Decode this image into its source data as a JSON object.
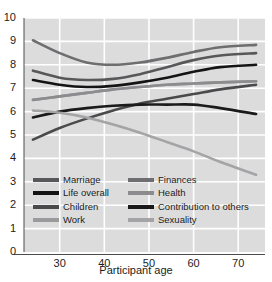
{
  "chart_data": {
    "type": "line",
    "title": "",
    "xlabel": "Participant age",
    "ylabel": "",
    "xlim": [
      22,
      76
    ],
    "ylim": [
      0,
      10
    ],
    "grid": true,
    "legend_position": "inside-bottom-left",
    "x_ticks": [
      "30",
      "40",
      "50",
      "60",
      "70"
    ],
    "x_tick_values": [
      30,
      40,
      50,
      60,
      70
    ],
    "y_ticks": [
      "0",
      "1",
      "2",
      "3",
      "4",
      "5",
      "6",
      "7",
      "8",
      "9",
      "10"
    ],
    "y_tick_values": [
      0,
      1,
      2,
      3,
      4,
      5,
      6,
      7,
      8,
      9,
      10
    ],
    "x": [
      24,
      30,
      36,
      42,
      48,
      54,
      60,
      66,
      74
    ],
    "series": [
      {
        "name": "Marriage",
        "color": "#58585a",
        "values": [
          7.75,
          7.45,
          7.35,
          7.4,
          7.6,
          7.9,
          8.2,
          8.4,
          8.5
        ]
      },
      {
        "name": "Life overall",
        "color": "#141414",
        "values": [
          7.35,
          7.15,
          7.05,
          7.1,
          7.25,
          7.45,
          7.7,
          7.9,
          8.0
        ]
      },
      {
        "name": "Children",
        "color": "#4a4a4c",
        "values": [
          4.8,
          5.3,
          5.7,
          6.05,
          6.35,
          6.55,
          6.75,
          6.95,
          7.15
        ]
      },
      {
        "name": "Work",
        "color": "#9a9a9c",
        "values": [
          6.5,
          6.65,
          6.8,
          6.95,
          7.05,
          7.15,
          7.2,
          7.25,
          7.3
        ]
      },
      {
        "name": "Finances",
        "color": "#6e6e70",
        "values": [
          9.05,
          8.5,
          8.1,
          8.0,
          8.1,
          8.3,
          8.55,
          8.75,
          8.85
        ]
      },
      {
        "name": "Health",
        "color": "#8c8c8e",
        "values": [
          6.5,
          6.65,
          6.8,
          6.95,
          7.05,
          7.15,
          7.2,
          7.25,
          7.3
        ]
      },
      {
        "name": "Contribution to others",
        "color": "#1a1a1a",
        "values": [
          5.75,
          6.0,
          6.15,
          6.25,
          6.3,
          6.3,
          6.3,
          6.15,
          5.9
        ]
      },
      {
        "name": "Sexuality",
        "color": "#a4a4a6",
        "values": [
          6.05,
          5.95,
          5.75,
          5.45,
          5.1,
          4.7,
          4.3,
          3.85,
          3.3
        ]
      }
    ]
  },
  "legend": {
    "items": [
      {
        "label": "Marriage",
        "color": "#58585a"
      },
      {
        "label": "Life overall",
        "color": "#141414"
      },
      {
        "label": "Children",
        "color": "#4a4a4c"
      },
      {
        "label": "Work",
        "color": "#9a9a9c"
      },
      {
        "label": "Finances",
        "color": "#6e6e70"
      },
      {
        "label": "Health",
        "color": "#8c8c8e"
      },
      {
        "label": "Contribution to others",
        "color": "#1a1a1a"
      },
      {
        "label": "Sexuality",
        "color": "#a4a4a6"
      }
    ]
  },
  "style": {
    "plot_background": "#dcdcdc",
    "gridline_color": "#ffffff",
    "axis_color": "#4d4d4d",
    "text_color": "#1c1c1c"
  }
}
